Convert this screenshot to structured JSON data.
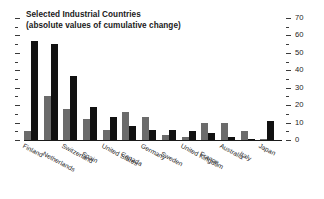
{
  "chart_data": {
    "type": "bar",
    "title": "Selected Industrial Countries",
    "subtitle": "(absolute values of cumulative change)",
    "xlabel": "",
    "ylabel": "",
    "ylim": [
      0,
      70
    ],
    "y_axis_position": "right",
    "grid": false,
    "legend": null,
    "major_ticks": [
      0,
      10,
      20,
      30,
      40,
      50,
      60,
      70
    ],
    "minor_tick_step": 5,
    "categories": [
      "Finland",
      "Netherlands",
      "Switzerland",
      "Spain",
      "United States",
      "Canada",
      "Germany",
      "Sweden",
      "United Kingdom",
      "France",
      "Australia",
      "Italy",
      "Japan"
    ],
    "series": [
      {
        "name": "series-gray",
        "color": "#6b6b6b",
        "values": [
          5,
          25,
          18,
          12,
          6,
          16,
          13,
          3,
          2,
          10,
          10,
          5,
          0.5
        ]
      },
      {
        "name": "series-black",
        "color": "#111111",
        "values": [
          57,
          55,
          37,
          19,
          13,
          8,
          6,
          6,
          5,
          4,
          1.5,
          0.5,
          11
        ]
      }
    ]
  },
  "axis": {
    "tick_labels": [
      "70",
      "60",
      "50",
      "40",
      "30",
      "20",
      "10",
      "0"
    ]
  }
}
